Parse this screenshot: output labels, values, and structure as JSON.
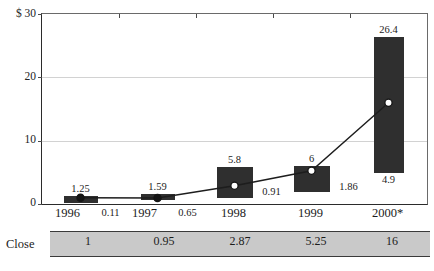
{
  "chart_data": {
    "type": "bar",
    "title": "",
    "xlabel": "",
    "ylabel": "$",
    "categories": [
      "1996",
      "1997",
      "1998",
      "1999",
      "2000*"
    ],
    "ylim": [
      0,
      30
    ],
    "yticks": [
      0,
      10,
      20,
      30
    ],
    "ytick_labels": [
      "0",
      "10",
      "20",
      "$ 30"
    ],
    "grid": true,
    "legend": "none",
    "series": [
      {
        "name": "High",
        "values": [
          1.25,
          1.59,
          5.8,
          6,
          26.4
        ]
      },
      {
        "name": "Low",
        "values": [
          0.11,
          0.65,
          0.91,
          1.86,
          4.9
        ]
      },
      {
        "name": "Close",
        "values": [
          1,
          0.95,
          2.87,
          5.25,
          16
        ]
      }
    ],
    "high_labels": [
      "1.25",
      "1.59",
      "5.8",
      "6",
      "26.4"
    ],
    "low_labels": [
      "0.11",
      "0.65",
      "0.91",
      "1.86",
      "4.9"
    ],
    "table": {
      "row_label": "Close",
      "values": [
        "1",
        "0.95",
        "2.87",
        "5.25",
        "16"
      ]
    }
  },
  "axis": {
    "y_top_label": "$ 30",
    "y_mid_upper_label": "20",
    "y_mid_lower_label": "10",
    "y_zero_label": "0"
  },
  "footnote": "",
  "title_clipped": ""
}
